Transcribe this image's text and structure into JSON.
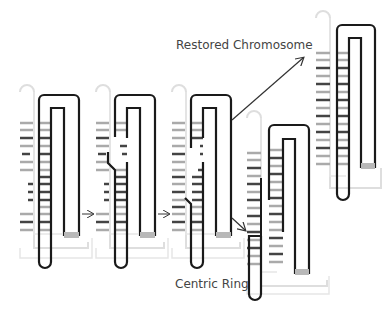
{
  "diagram": {
    "type": "chromosome-restoration-schematic",
    "labels": {
      "restored": "Restored Chromosome",
      "centric_ring": "Centric Ring"
    },
    "colors": {
      "dark_strand": "#1a1a1a",
      "light_strand": "#dedede",
      "rung_grey": "#a8a8a8",
      "rung_dark": "#333333",
      "cap": "#b8b8b8",
      "arrow": "#333333"
    },
    "panels": [
      {
        "id": "panel-1",
        "description": "Folded chromosome with paired strands"
      },
      {
        "id": "panel-2",
        "description": "Strand break and exchange begins"
      },
      {
        "id": "panel-3",
        "description": "Crossed strand exchange"
      },
      {
        "id": "panel-4",
        "description": "Centric ring product"
      },
      {
        "id": "panel-5",
        "description": "Restored chromosome product"
      }
    ],
    "arrows": [
      {
        "from": "panel-1",
        "to": "panel-2"
      },
      {
        "from": "panel-2",
        "to": "panel-3"
      },
      {
        "from": "panel-3",
        "to": "panel-4"
      },
      {
        "from": "panel-3",
        "to": "panel-5"
      }
    ]
  }
}
